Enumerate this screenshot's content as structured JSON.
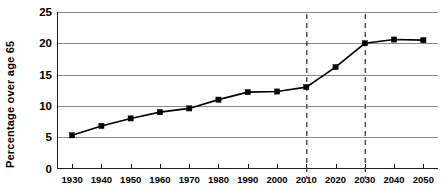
{
  "chart_data": {
    "type": "line",
    "title": "",
    "xlabel": "",
    "ylabel": "Percentage over age 65",
    "categories": [
      1930,
      1940,
      1950,
      1960,
      1970,
      1980,
      1990,
      2000,
      2010,
      2020,
      2030,
      2040,
      2050
    ],
    "x": [
      1930,
      1940,
      1950,
      1960,
      1970,
      1980,
      1990,
      2000,
      2010,
      2020,
      2030,
      2040,
      2050
    ],
    "values": [
      5.3,
      6.8,
      8.0,
      9.0,
      9.6,
      11.0,
      12.2,
      12.3,
      13.0,
      16.2,
      20.0,
      20.6,
      20.5
    ],
    "series": [
      {
        "name": "Percentage over age 65",
        "values": [
          5.3,
          6.8,
          8.0,
          9.0,
          9.6,
          11.0,
          12.2,
          12.3,
          13.0,
          16.2,
          20.0,
          20.6,
          20.5
        ]
      }
    ],
    "xlim": [
      1925,
      2055
    ],
    "ylim": [
      0,
      25
    ],
    "y_ticks": [
      0,
      5,
      10,
      15,
      20,
      25
    ],
    "y_tick_labels": [
      "0",
      "5",
      "10",
      "15",
      "20",
      "25"
    ],
    "x_ticks": [
      1930,
      1940,
      1950,
      1960,
      1970,
      1980,
      1990,
      2000,
      2010,
      2020,
      2030,
      2040,
      2050
    ],
    "x_tick_labels": [
      "1930",
      "1940",
      "1950",
      "1960",
      "1970",
      "1980",
      "1990",
      "2000",
      "2010",
      "2020",
      "2030",
      "2040",
      "2050"
    ],
    "grid": "horizontal",
    "legend": "none",
    "annotations": [
      {
        "type": "vertical-dashed-line",
        "x": 2010,
        "label": ""
      },
      {
        "type": "vertical-dashed-line",
        "x": 2030,
        "label": ""
      }
    ],
    "marker": "square",
    "colors": {
      "line": "#000000",
      "marker": "#000000",
      "grid": "#8a8a8a",
      "axis": "#1a1a1a",
      "reference_line": "#4a4a4a",
      "background": "#ffffff"
    }
  }
}
